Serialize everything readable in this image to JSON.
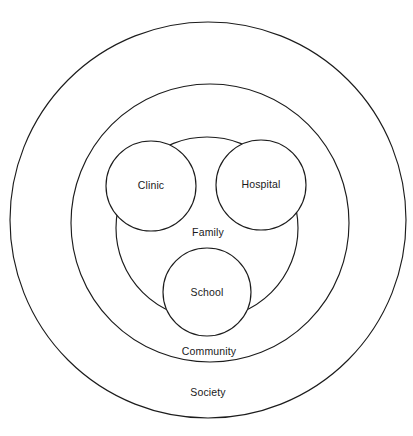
{
  "diagram": {
    "type": "nested-circles",
    "stroke_color": "#1c1c1c",
    "background_color": "#ffffff",
    "text_color": "#1a1a1a",
    "rings": [
      {
        "id": "society",
        "label": "Society",
        "level": 1,
        "cx": 208,
        "cy": 220,
        "r": 198,
        "label_x": 208,
        "label_y": 393
      },
      {
        "id": "community",
        "label": "Community",
        "level": 2,
        "cx": 210,
        "cy": 223,
        "r": 139,
        "label_x": 209,
        "label_y": 352
      },
      {
        "id": "family",
        "label": "Family",
        "level": 3,
        "cx": 207,
        "cy": 228,
        "r": 91,
        "label_x": 208,
        "label_y": 233
      }
    ],
    "nodes": [
      {
        "id": "clinic",
        "label": "Clinic",
        "cx": 151,
        "cy": 186,
        "r": 45,
        "label_x": 151,
        "label_y": 186
      },
      {
        "id": "hospital",
        "label": "Hospital",
        "cx": 261,
        "cy": 185,
        "r": 45,
        "label_x": 261,
        "label_y": 185
      },
      {
        "id": "school",
        "label": "School",
        "cx": 207,
        "cy": 292,
        "r": 44,
        "label_x": 207,
        "label_y": 293
      }
    ]
  }
}
